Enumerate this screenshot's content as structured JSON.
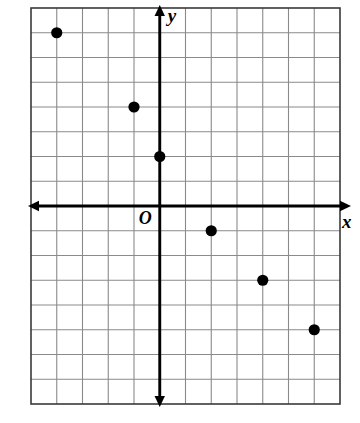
{
  "figure": {
    "background_color": "#ffffff",
    "border_color": "#3a3a3a",
    "grid_color": "#8a8a8a",
    "axis_color": "#000000",
    "point_color": "#000000"
  },
  "labels": {
    "x_axis": "x",
    "y_axis": "y",
    "origin": "O"
  },
  "chart_data": {
    "type": "scatter",
    "title": "",
    "xlabel": "x",
    "ylabel": "y",
    "origin_label": "O",
    "grid": true,
    "legend": null,
    "xlim": [
      -5,
      7
    ],
    "ylim": [
      -8,
      8
    ],
    "x_tick_step": 1,
    "y_tick_step": 1,
    "tick_labels_shown": false,
    "series": [
      {
        "name": "points",
        "marker": "filled-circle",
        "color": "#000000",
        "points": [
          {
            "x": -4,
            "y": 7
          },
          {
            "x": -1,
            "y": 4
          },
          {
            "x": 0,
            "y": 2
          },
          {
            "x": 2,
            "y": -1
          },
          {
            "x": 4,
            "y": -3
          },
          {
            "x": 6,
            "y": -5
          }
        ]
      }
    ]
  }
}
